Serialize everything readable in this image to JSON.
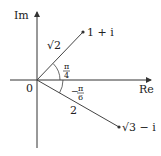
{
  "diagram": {
    "type": "complex-plane",
    "axes": {
      "x_label": "Re",
      "y_label": "Im",
      "origin_label": "0"
    },
    "points": [
      {
        "label": "1 + i",
        "modulus_label": "√2",
        "angle_label_num": "π",
        "angle_label_den": "4"
      },
      {
        "label": "√3 − i",
        "modulus_label": "2",
        "angle_label_sign": "−",
        "angle_label_num": "π",
        "angle_label_den": "6"
      }
    ],
    "colors": {
      "line": "#333333",
      "text": "#222222"
    }
  }
}
